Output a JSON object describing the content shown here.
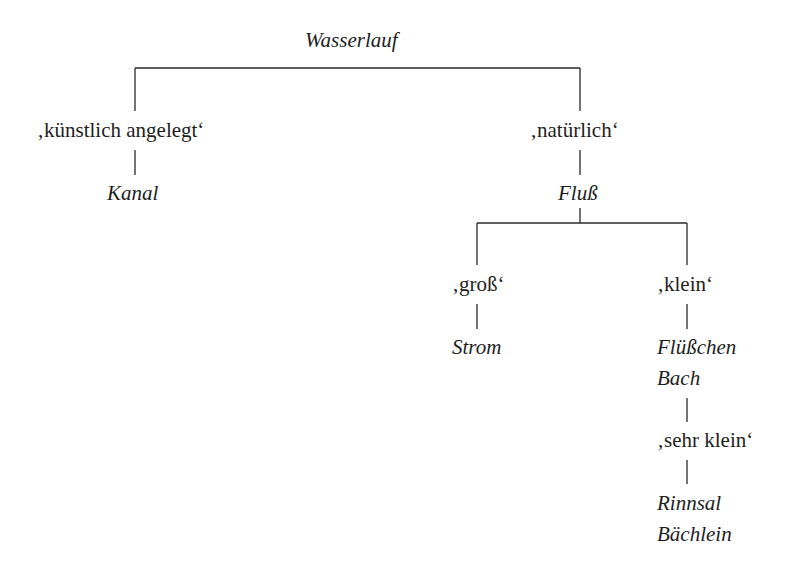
{
  "diagram": {
    "type": "semantic-feature-tree",
    "root": {
      "label": "Wasserlauf"
    },
    "branches": {
      "kuenstlich": {
        "feature": "‚künstlich angelegt‘",
        "terms": [
          "Kanal"
        ]
      },
      "natuerlich": {
        "feature": "‚natürlich‘",
        "terms": [
          "Fluß"
        ],
        "branches": {
          "gross": {
            "feature": "‚groß‘",
            "terms": [
              "Strom"
            ]
          },
          "klein": {
            "feature": "‚klein‘",
            "terms": [
              "Flüßchen",
              "Bach"
            ],
            "branches": {
              "sehr_klein": {
                "feature": "‚sehr klein‘",
                "terms": [
                  "Rinnsal",
                  "Bächlein"
                ]
              }
            }
          }
        }
      }
    }
  },
  "colors": {
    "text": "#1e1e1e",
    "lines": "#2a2a2a",
    "background": "#ffffff"
  }
}
